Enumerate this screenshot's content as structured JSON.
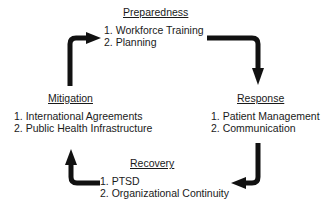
{
  "diagram": {
    "type": "cycle",
    "colors": {
      "text": "#1a1a1a",
      "arrow": "#111111",
      "background": "#ffffff"
    },
    "stages": [
      {
        "id": "preparedness",
        "title": "Preparedness",
        "items": [
          "1. Workforce Training",
          "2. Planning"
        ]
      },
      {
        "id": "response",
        "title": "Response",
        "items": [
          "1. Patient Management",
          "2. Communication"
        ]
      },
      {
        "id": "recovery",
        "title": "Recovery",
        "items": [
          "1. PTSD",
          "2. Organizational Continuity"
        ]
      },
      {
        "id": "mitigation",
        "title": "Mitigation",
        "items": [
          "1. International Agreements",
          "2. Public Health Infrastructure"
        ]
      }
    ],
    "arrows": [
      {
        "from": "mitigation",
        "to": "preparedness"
      },
      {
        "from": "preparedness",
        "to": "response"
      },
      {
        "from": "response",
        "to": "recovery"
      },
      {
        "from": "recovery",
        "to": "mitigation"
      }
    ]
  }
}
